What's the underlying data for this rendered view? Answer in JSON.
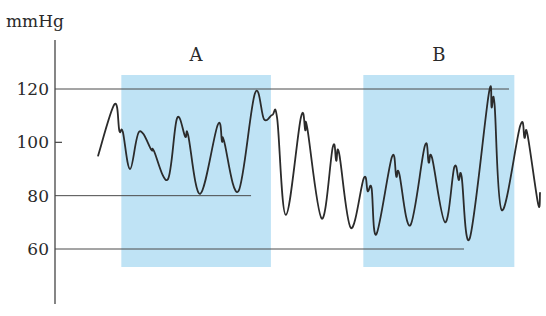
{
  "chart_data": {
    "type": "line",
    "title": "",
    "xlabel": "",
    "ylabel": "mmHg",
    "ylim": [
      40,
      128
    ],
    "y_ticks": [
      {
        "value": 120,
        "label": "120",
        "style": "reference-line"
      },
      {
        "value": 100,
        "label": "100",
        "style": "tick"
      },
      {
        "value": 80,
        "label": "80",
        "style": "reference-line"
      },
      {
        "value": 60,
        "label": "60",
        "style": "reference-line"
      }
    ],
    "grid": false,
    "legend": "none",
    "x_range": [
      0,
      100
    ],
    "regions": [
      {
        "label": "A",
        "x_start": 13.5,
        "x_end": 44.4,
        "color": "#bfe3f5"
      },
      {
        "label": "B",
        "x_start": 63.5,
        "x_end": 94.7,
        "color": "#bfe3f5"
      }
    ],
    "reference_lines": [
      {
        "value": 120,
        "x_start": 0,
        "x_end": 93.6
      },
      {
        "value": 80,
        "x_start": 0,
        "x_end": 40.3
      },
      {
        "value": 60,
        "x_start": 0,
        "x_end": 84.3
      }
    ],
    "series": [
      {
        "name": "Blood pressure",
        "color": "#2b2b2b",
        "points": [
          [
            8.7,
            95.0
          ],
          [
            12.1,
            114.3
          ],
          [
            13.1,
            104.3
          ],
          [
            13.8,
            104.0
          ],
          [
            15.3,
            90.0
          ],
          [
            17.2,
            104.0
          ],
          [
            19.7,
            97.2
          ],
          [
            20.2,
            96.9
          ],
          [
            23.1,
            86.1
          ],
          [
            25.0,
            109.0
          ],
          [
            26.7,
            102.1
          ],
          [
            27.3,
            102.8
          ],
          [
            29.8,
            80.7
          ],
          [
            33.4,
            106.5
          ],
          [
            34.3,
            100.3
          ],
          [
            34.7,
            100.7
          ],
          [
            37.7,
            81.7
          ],
          [
            41.1,
            118.3
          ],
          [
            43.0,
            108.6
          ],
          [
            44.7,
            110.3
          ],
          [
            45.7,
            108.9
          ],
          [
            47.5,
            72.8
          ],
          [
            50.6,
            109.3
          ],
          [
            51.5,
            104.5
          ],
          [
            51.9,
            105.5
          ],
          [
            54.9,
            71.4
          ],
          [
            57.2,
            98.3
          ],
          [
            57.9,
            93.1
          ],
          [
            58.5,
            95.9
          ],
          [
            60.9,
            67.9
          ],
          [
            63.6,
            86.6
          ],
          [
            64.4,
            81.7
          ],
          [
            65.2,
            82.8
          ],
          [
            66.2,
            65.5
          ],
          [
            69.4,
            94.5
          ],
          [
            70.3,
            87.2
          ],
          [
            70.9,
            88.3
          ],
          [
            73.2,
            68.9
          ],
          [
            76.2,
            98.6
          ],
          [
            77.0,
            92.4
          ],
          [
            77.7,
            94.1
          ],
          [
            80.4,
            70.0
          ],
          [
            82.3,
            90.7
          ],
          [
            83.2,
            85.9
          ],
          [
            83.8,
            87.2
          ],
          [
            85.5,
            64.1
          ],
          [
            89.4,
            118.0
          ],
          [
            90.0,
            113.1
          ],
          [
            90.6,
            114.5
          ],
          [
            92.1,
            74.5
          ],
          [
            95.9,
            106.2
          ],
          [
            96.8,
            101.7
          ],
          [
            97.4,
            103.1
          ],
          [
            99.6,
            76.9
          ],
          [
            100.0,
            81.0
          ]
        ]
      }
    ]
  }
}
